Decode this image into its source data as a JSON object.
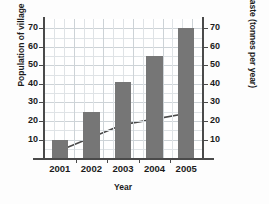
{
  "chart_data": {
    "type": "bar",
    "title": "",
    "categories": [
      "2001",
      "2002",
      "2003",
      "2004",
      "2005"
    ],
    "xlabel": "Year",
    "ylabel": "Population of village",
    "y2label": "Waste (tonnes per year)",
    "ylim": [
      0,
      75
    ],
    "y2lim": [
      0,
      75
    ],
    "yticks": [
      10,
      20,
      30,
      40,
      50,
      60,
      70
    ],
    "y2ticks": [
      10,
      20,
      30,
      40,
      50,
      60,
      70
    ],
    "grid": true,
    "legend": "none",
    "series": [
      {
        "name": "Population of village",
        "type": "bar",
        "axis": "left",
        "color": "#767676",
        "values": [
          10,
          25,
          41,
          55,
          70
        ]
      },
      {
        "name": "Waste (tonnes per year)",
        "type": "line",
        "axis": "right",
        "color": "#4a4a4a",
        "values": [
          4,
          11,
          18,
          21,
          24
        ]
      }
    ]
  },
  "axes": {
    "x_title": "Year",
    "y_left_title": "Population of village",
    "y_right_title": "Waste (tonnes per year)",
    "y_left_ticks": [
      "70",
      "60",
      "50",
      "40",
      "30",
      "20",
      "10"
    ],
    "y_right_ticks": [
      "70",
      "60",
      "50",
      "40",
      "30",
      "20",
      "10"
    ],
    "x_ticks": [
      "2001",
      "2002",
      "2003",
      "2004",
      "2005"
    ]
  },
  "colors": {
    "bar": "#767676",
    "line": "#4a4a4a",
    "axis": "#4a4a4a",
    "grid": "#dfe3e6",
    "background": "#ffffff"
  }
}
